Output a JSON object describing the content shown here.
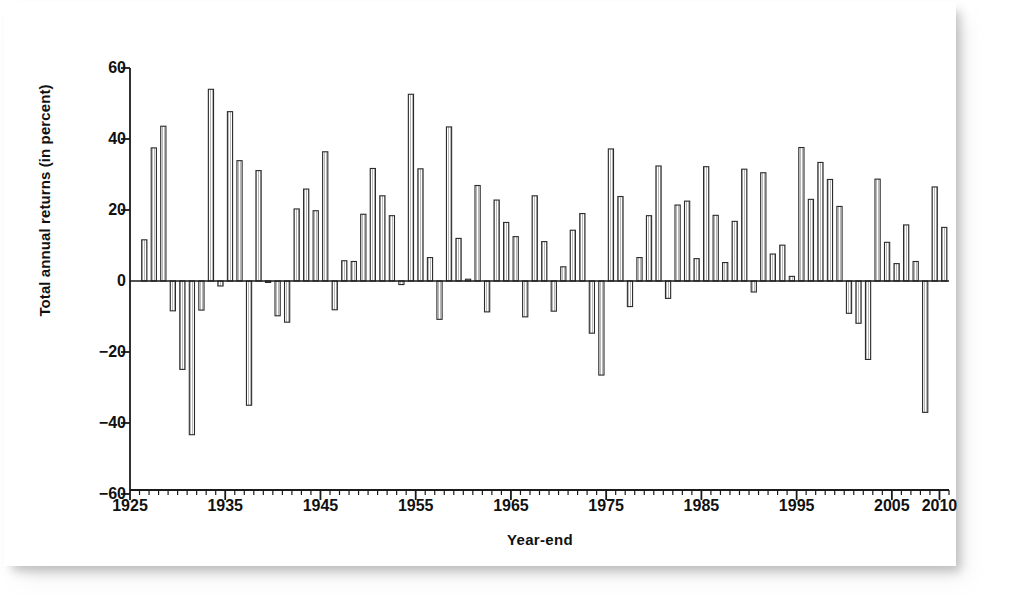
{
  "figure": {
    "plot_bg": "#ffffff",
    "axis_color": "#1a1a1a",
    "bar_fill": "#ffffff",
    "bar_edge": "#2b2b2b",
    "bar_hatch": "#7d7d7d"
  },
  "axes": {
    "y_title": "Total annual returns (in percent)",
    "x_title": "Year-end",
    "y_ticks": [
      {
        "value": 60,
        "label": "60"
      },
      {
        "value": 40,
        "label": "40"
      },
      {
        "value": 20,
        "label": "20"
      },
      {
        "value": 0,
        "label": "0"
      },
      {
        "value": -20,
        "label": "−20"
      },
      {
        "value": -40,
        "label": "−40"
      },
      {
        "value": -60,
        "label": "−60"
      }
    ],
    "x_major_ticks": [
      {
        "value": 1925,
        "label": "1925"
      },
      {
        "value": 1935,
        "label": "1935"
      },
      {
        "value": 1945,
        "label": "1945"
      },
      {
        "value": 1955,
        "label": "1955"
      },
      {
        "value": 1965,
        "label": "1965"
      },
      {
        "value": 1975,
        "label": "1975"
      },
      {
        "value": 1985,
        "label": "1985"
      },
      {
        "value": 1995,
        "label": "1995"
      },
      {
        "value": 2005,
        "label": "2005"
      },
      {
        "value": 2010,
        "label": "2010"
      }
    ],
    "x_minor_interval": 1,
    "x_range": [
      1925,
      2011
    ],
    "y_range": [
      -60,
      60
    ],
    "grid": false
  },
  "chart_data": {
    "type": "bar",
    "title": "",
    "xlabel": "Year-end",
    "ylabel": "Total annual returns (in percent)",
    "xlim": [
      1925,
      2011
    ],
    "ylim": [
      -60,
      60
    ],
    "grid": false,
    "legend": null,
    "categories": [
      1926,
      1927,
      1928,
      1929,
      1930,
      1931,
      1932,
      1933,
      1934,
      1935,
      1936,
      1937,
      1938,
      1939,
      1940,
      1941,
      1942,
      1943,
      1944,
      1945,
      1946,
      1947,
      1948,
      1949,
      1950,
      1951,
      1952,
      1953,
      1954,
      1955,
      1956,
      1957,
      1958,
      1959,
      1960,
      1961,
      1962,
      1963,
      1964,
      1965,
      1966,
      1967,
      1968,
      1969,
      1970,
      1971,
      1972,
      1973,
      1974,
      1975,
      1976,
      1977,
      1978,
      1979,
      1980,
      1981,
      1982,
      1983,
      1984,
      1985,
      1986,
      1987,
      1988,
      1989,
      1990,
      1991,
      1992,
      1993,
      1994,
      1995,
      1996,
      1997,
      1998,
      1999,
      2000,
      2001,
      2002,
      2003,
      2004,
      2005,
      2006,
      2007,
      2008,
      2009,
      2010
    ],
    "values": [
      11.6,
      37.5,
      43.6,
      -8.4,
      -24.9,
      -43.3,
      -8.2,
      54.0,
      -1.4,
      47.7,
      33.9,
      -35.0,
      31.1,
      -0.4,
      -9.8,
      -11.6,
      20.3,
      25.9,
      19.8,
      36.4,
      -8.1,
      5.7,
      5.5,
      18.8,
      31.7,
      24.0,
      18.4,
      -1.0,
      52.6,
      31.6,
      6.6,
      -10.8,
      43.4,
      12.0,
      0.5,
      26.9,
      -8.7,
      22.8,
      16.5,
      12.5,
      -10.1,
      24.0,
      11.1,
      -8.5,
      4.0,
      14.3,
      19.0,
      -14.7,
      -26.5,
      37.2,
      23.8,
      -7.2,
      6.6,
      18.4,
      32.4,
      -4.9,
      21.4,
      22.5,
      6.3,
      32.2,
      18.5,
      5.2,
      16.8,
      31.5,
      -3.1,
      30.5,
      7.6,
      10.1,
      1.3,
      37.6,
      23.0,
      33.4,
      28.6,
      21.0,
      -9.1,
      -11.9,
      -22.1,
      28.7,
      10.9,
      4.9,
      15.8,
      5.5,
      -37.0,
      26.5,
      15.1
    ]
  }
}
